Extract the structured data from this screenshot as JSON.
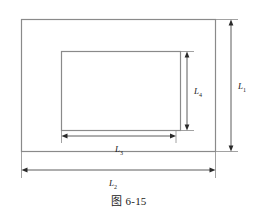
{
  "figure": {
    "caption": "图 6-15",
    "shapes": {
      "outer_rectangle_name": "outer-plate-rectangle",
      "inner_rectangle_name": "inner-hole-rectangle"
    },
    "dimensions": [
      {
        "id": "L1",
        "base": "L",
        "subscript": "1",
        "orientation": "vertical",
        "position": "right",
        "measures": "outer rectangle height"
      },
      {
        "id": "L2",
        "base": "L",
        "subscript": "2",
        "orientation": "horizontal",
        "position": "bottom",
        "measures": "outer rectangle width"
      },
      {
        "id": "L3",
        "base": "L",
        "subscript": "3",
        "orientation": "horizontal",
        "position": "inner-bottom",
        "measures": "inner rectangle width"
      },
      {
        "id": "L4",
        "base": "L",
        "subscript": "4",
        "orientation": "vertical",
        "position": "inner-right",
        "measures": "inner rectangle height"
      }
    ],
    "colors": {
      "line": "#808080",
      "dimension_line": "#3a3a3a",
      "text": "#1a1a1a",
      "background": "#ffffff"
    }
  }
}
